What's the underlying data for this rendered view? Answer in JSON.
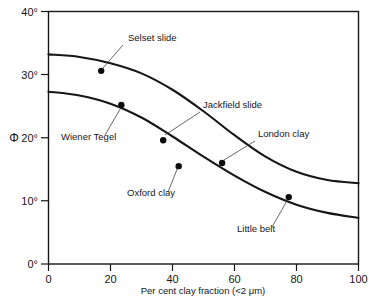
{
  "figure": {
    "background": "#ffffff",
    "ink_color": "#161616"
  },
  "chart_data": {
    "type": "line",
    "title": "",
    "xlabel": "Per cent clay fraction (<2  μm)",
    "ylabel": "Φ",
    "xlim": [
      0,
      100
    ],
    "ylim": [
      0,
      40
    ],
    "grid": false,
    "legend": "none",
    "xticks": [
      0,
      20,
      40,
      60,
      80,
      100
    ],
    "xtick_labels": [
      "0",
      "20",
      "40",
      "60",
      "80",
      "100"
    ],
    "yticks": [
      0,
      10,
      20,
      30,
      40
    ],
    "ytick_labels": [
      "0°",
      "10°",
      "20°",
      "30°",
      "40°"
    ],
    "series": [
      {
        "name": "upper-curve",
        "x": [
          0,
          10,
          20,
          30,
          40,
          50,
          60,
          70,
          80,
          90,
          100
        ],
        "y": [
          33.2,
          32.8,
          31.8,
          30.2,
          27.6,
          24.2,
          20.4,
          17.0,
          14.6,
          13.3,
          12.8
        ]
      },
      {
        "name": "lower-curve",
        "x": [
          0,
          10,
          20,
          30,
          40,
          50,
          60,
          70,
          80,
          90,
          100
        ],
        "y": [
          27.3,
          26.7,
          25.4,
          23.2,
          20.2,
          17.0,
          14.0,
          11.4,
          9.4,
          8.1,
          7.3
        ]
      }
    ],
    "points": [
      {
        "label": "Selset slide",
        "x": 17,
        "y": 30.6
      },
      {
        "label": "Wiener Tegel",
        "x": 23.5,
        "y": 25.2
      },
      {
        "label": "Jackfield slide",
        "x": 37,
        "y": 19.6
      },
      {
        "label": "Oxford clay",
        "x": 42,
        "y": 15.5
      },
      {
        "label": "London clay",
        "x": 56,
        "y": 16.0
      },
      {
        "label": "Little belt",
        "x": 77.5,
        "y": 10.6
      }
    ],
    "annotations": [
      {
        "text": "Selset slide",
        "tx": 128,
        "ty": 41,
        "lx0": 123,
        "ly0": 45,
        "lx1": 103,
        "ly1": 68
      },
      {
        "text": "Wiener Tegel",
        "tx": 61,
        "ty": 140,
        "lx0": 105,
        "ly0": 135,
        "lx1": 122,
        "ly1": 106
      },
      {
        "text": "Jackfield slide",
        "tx": 203,
        "ty": 108,
        "lx0": 200,
        "ly0": 112,
        "lx1": 165,
        "ly1": 135
      },
      {
        "text": "London clay",
        "tx": 258,
        "ty": 137,
        "lx0": 255,
        "ly0": 141,
        "lx1": 224,
        "ly1": 160
      },
      {
        "text": "Oxford clay",
        "tx": 127,
        "ty": 196,
        "lx0": 168,
        "ly0": 192,
        "lx1": 178,
        "ly1": 167
      },
      {
        "text": "Little belt",
        "tx": 237,
        "ty": 232,
        "lx0": 272,
        "ly0": 227,
        "lx1": 288,
        "ly1": 199
      }
    ]
  },
  "axes": {
    "phi_symbol": "Φ",
    "x_axis_title": "Per cent clay fraction (<2  μm)"
  }
}
